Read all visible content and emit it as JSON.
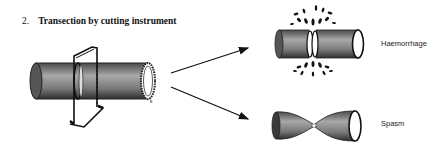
{
  "title": {
    "number": "2.",
    "text": "Transection by cutting instrument"
  },
  "outcomes": [
    {
      "label": "Haemorrhage"
    },
    {
      "label": "Spasm"
    }
  ],
  "colors": {
    "ink": "#111111",
    "tube_dark": "#3a3a3a",
    "tube_light": "#9a9a9a",
    "background": "#ffffff"
  }
}
